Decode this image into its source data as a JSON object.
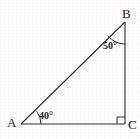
{
  "figure": {
    "type": "geometry-diagram",
    "shape": "right-triangle",
    "background_color": "#fefefe",
    "stroke_color": "#2b2b2b",
    "vertices": {
      "A": {
        "label": "A",
        "x": 21,
        "y": 124
      },
      "B": {
        "label": "B",
        "x": 125,
        "y": 22
      },
      "C": {
        "label": "C",
        "x": 125,
        "y": 124
      }
    },
    "angles": {
      "at_A": {
        "value": "40°",
        "marker": "arc"
      },
      "at_B": {
        "value": "50°",
        "marker": "arc"
      },
      "at_C": {
        "value": "90°",
        "marker": "right-angle-square"
      }
    },
    "sides": [
      {
        "name": "AB",
        "role": "hypotenuse"
      },
      {
        "name": "AC",
        "role": "base"
      },
      {
        "name": "BC",
        "role": "vertical-leg"
      }
    ]
  }
}
